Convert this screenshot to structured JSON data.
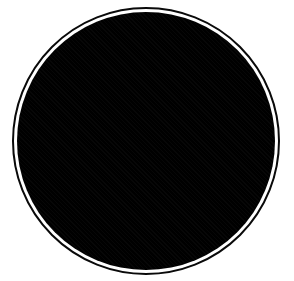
{
  "image": {
    "kind": "circular-aperture-intensity-map",
    "width": 294,
    "height": 281,
    "background_color": "#ffffff",
    "alt_text": "Circular aperture with a bright radially symmetric glow fading to black toward the rim"
  },
  "aperture_ring": {
    "center_x": 146,
    "center_y": 141,
    "outer_radius": 134,
    "stroke_width": 2,
    "stroke_color": "#0a0a0a",
    "gap_color": "#ffffff",
    "gap_width": 3
  },
  "intensity_disk": {
    "center_x": 146,
    "center_y": 141,
    "radius": 129,
    "fill_color": "#000000"
  },
  "chart_data": {
    "type": "heatmap",
    "title": "",
    "xlabel": "",
    "ylabel": "",
    "colormap": "grayscale",
    "value_min": 0,
    "value_max": 255,
    "peak": {
      "x": 150,
      "y": 153,
      "value": 250,
      "color": "#fafafa"
    },
    "profile": "radial-gaussian",
    "radial_profile": {
      "r": [
        0,
        10,
        20,
        30,
        40,
        50,
        60,
        70,
        80,
        90,
        100,
        110,
        120,
        129
      ],
      "value": [
        250,
        247,
        238,
        222,
        198,
        166,
        130,
        94,
        62,
        36,
        18,
        7,
        2,
        0
      ]
    },
    "stops": [
      {
        "offset_pct": 0,
        "color": "#fafafa"
      },
      {
        "offset_pct": 8,
        "color": "#f4f4f4"
      },
      {
        "offset_pct": 16,
        "color": "#e6e6e6"
      },
      {
        "offset_pct": 24,
        "color": "#d2d2d2"
      },
      {
        "offset_pct": 32,
        "color": "#b4b4b4"
      },
      {
        "offset_pct": 40,
        "color": "#909090"
      },
      {
        "offset_pct": 48,
        "color": "#6a6a6a"
      },
      {
        "offset_pct": 56,
        "color": "#4a4a4a"
      },
      {
        "offset_pct": 64,
        "color": "#2f2f2f"
      },
      {
        "offset_pct": 72,
        "color": "#1b1b1b"
      },
      {
        "offset_pct": 80,
        "color": "#0d0d0d"
      },
      {
        "offset_pct": 88,
        "color": "#050505"
      },
      {
        "offset_pct": 100,
        "color": "#000000"
      }
    ],
    "glow_center_pct_x": 51,
    "glow_center_pct_y": 55,
    "glow_extent_pct": 95,
    "grid": false,
    "legend": false,
    "axes": false
  }
}
